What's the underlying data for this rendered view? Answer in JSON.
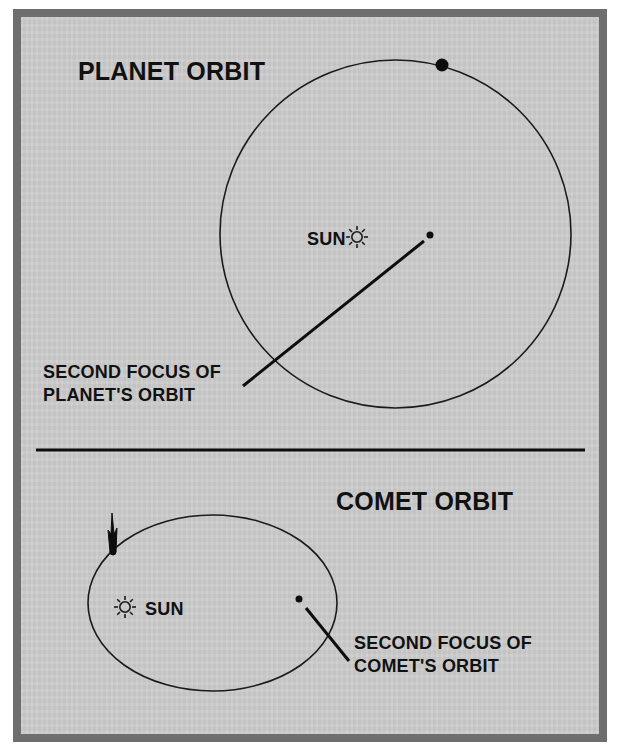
{
  "planet_section": {
    "title": "PLANET ORBIT",
    "sun_label": "SUN",
    "focus_label_line1": "SECOND FOCUS OF",
    "focus_label_line2": "PLANET'S ORBIT",
    "icons": {
      "sun": "sun-icon",
      "planet": "planet-dot-icon",
      "focus": "focus-dot-icon"
    }
  },
  "comet_section": {
    "title": "COMET ORBIT",
    "sun_label": "SUN",
    "focus_label_line1": "SECOND FOCUS OF",
    "focus_label_line2": "COMET'S ORBIT",
    "icons": {
      "sun": "sun-icon",
      "comet": "comet-icon",
      "focus": "focus-dot-icon"
    }
  },
  "colors": {
    "frame_border": "#6e6e6e",
    "background": "#cbcbcb",
    "ink": "#111111"
  }
}
